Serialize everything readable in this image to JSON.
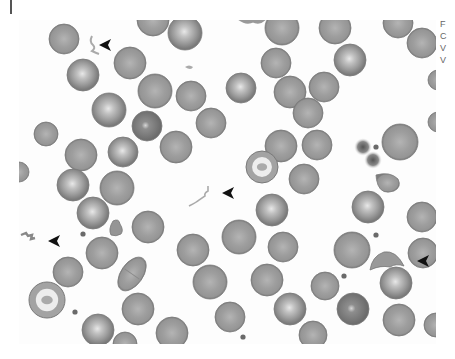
{
  "figure": {
    "kind": "blood smear micrograph",
    "background": "#fdfdfd",
    "cell_fill": "#9c9c9c",
    "cell_rim": "#7a7a7a",
    "cell_center": "#c8c8c8",
    "platelet_color": "#6a6a6a",
    "arrow_color": "#111111"
  },
  "caption_fragment": [
    "F",
    "C",
    "V",
    "V"
  ],
  "cells": [
    [
      45,
      19,
      15,
      0
    ],
    [
      64,
      55,
      16,
      1
    ],
    [
      111,
      43,
      16,
      0
    ],
    [
      136,
      71,
      17,
      0
    ],
    [
      172,
      76,
      15,
      0
    ],
    [
      90,
      90,
      17,
      1
    ],
    [
      128,
      106,
      15,
      2
    ],
    [
      192,
      103,
      15,
      0
    ],
    [
      27,
      114,
      12,
      0
    ],
    [
      62,
      135,
      16,
      0
    ],
    [
      104,
      132,
      15,
      1
    ],
    [
      157,
      127,
      16,
      0
    ],
    [
      134,
      0,
      16,
      0
    ],
    [
      166,
      13,
      17,
      1
    ],
    [
      263,
      8,
      17,
      0
    ],
    [
      316,
      8,
      16,
      0
    ],
    [
      379,
      3,
      15,
      0
    ],
    [
      403,
      23,
      15,
      0
    ],
    [
      257,
      43,
      15,
      0
    ],
    [
      331,
      40,
      16,
      1
    ],
    [
      222,
      68,
      15,
      1
    ],
    [
      271,
      72,
      16,
      0
    ],
    [
      305,
      67,
      15,
      0
    ],
    [
      289,
      93,
      15,
      0
    ],
    [
      262,
      126,
      16,
      0
    ],
    [
      298,
      125,
      15,
      0
    ],
    [
      381,
      122,
      18,
      0
    ],
    [
      419,
      60,
      10,
      0
    ],
    [
      419,
      102,
      10,
      0
    ],
    [
      54,
      165,
      16,
      1
    ],
    [
      98,
      168,
      17,
      0
    ],
    [
      74,
      193,
      16,
      1
    ],
    [
      129,
      207,
      16,
      0
    ],
    [
      83,
      233,
      16,
      0
    ],
    [
      174,
      230,
      16,
      0
    ],
    [
      49,
      252,
      15,
      0
    ],
    [
      191,
      262,
      17,
      0
    ],
    [
      119,
      289,
      16,
      0
    ],
    [
      79,
      310,
      16,
      1
    ],
    [
      153,
      313,
      16,
      0
    ],
    [
      106,
      324,
      12,
      0
    ],
    [
      285,
      159,
      15,
      0
    ],
    [
      253,
      190,
      16,
      1
    ],
    [
      349,
      187,
      16,
      1
    ],
    [
      403,
      197,
      15,
      0
    ],
    [
      220,
      217,
      17,
      0
    ],
    [
      264,
      227,
      15,
      0
    ],
    [
      333,
      230,
      18,
      0
    ],
    [
      404,
      233,
      15,
      0
    ],
    [
      248,
      260,
      16,
      0
    ],
    [
      306,
      266,
      14,
      0
    ],
    [
      377,
      263,
      16,
      1
    ],
    [
      271,
      289,
      16,
      1
    ],
    [
      334,
      289,
      16,
      2
    ],
    [
      380,
      300,
      16,
      0
    ],
    [
      211,
      297,
      15,
      0
    ],
    [
      294,
      315,
      14,
      0
    ],
    [
      417,
      305,
      12,
      0
    ],
    [
      0,
      152,
      10,
      0
    ]
  ],
  "special_cells": {
    "target_cells": [
      [
        28,
        280,
        18
      ],
      [
        243,
        147,
        16
      ]
    ],
    "peanut_cell": [
      113,
      254
    ],
    "small_misshapen": [
      97,
      210
    ],
    "teardrop": [
      369,
      165
    ],
    "helmet_cell": [
      368,
      238
    ]
  },
  "dots": [
    [
      64,
      214
    ],
    [
      56,
      292
    ],
    [
      357,
      127
    ],
    [
      325,
      256
    ],
    [
      357,
      215
    ],
    [
      224,
      317
    ]
  ],
  "platelet_clumps": [
    [
      344,
      127
    ],
    [
      354,
      140
    ]
  ],
  "arrowheads": [
    {
      "id": "arrow-1",
      "x": 80,
      "y": 25,
      "points_to": "left"
    },
    {
      "id": "arrow-2",
      "x": 203,
      "y": 173,
      "points_to": "left"
    },
    {
      "id": "arrow-3",
      "x": 29,
      "y": 221,
      "points_to": "left"
    },
    {
      "id": "arrow-4",
      "x": 398,
      "y": 241,
      "points_to": "left"
    }
  ]
}
